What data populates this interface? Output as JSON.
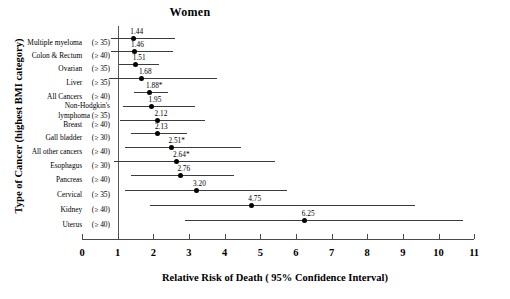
{
  "chart_data": {
    "type": "scatter",
    "subtype": "forest-plot",
    "title": "Women",
    "xlabel": "Relative Risk of Death ( 95% Confidence Interval)",
    "ylabel": "Type of Cancer  (highest BMI category)",
    "xlim": [
      0,
      11
    ],
    "xticks": [
      0,
      1,
      2,
      3,
      4,
      5,
      6,
      7,
      8,
      9,
      10,
      11
    ],
    "xtick_labels": [
      "0",
      "1",
      "2",
      "3",
      "4",
      "5",
      "6",
      "7",
      "8",
      "9",
      "10",
      "11"
    ],
    "grid": false,
    "legend": null,
    "reference_line": 1,
    "annotation_note": "* marks statistically significant estimates",
    "categories": [
      "Multiple myeloma",
      "Colon & Rectum",
      "Ovarian",
      "Liver",
      "All Cancers",
      "Non-Hodgkin's lymphoma",
      "Breast",
      "Gall bladder",
      "All other cancers",
      "Esophagus",
      "Pancreas",
      "Cervical",
      "Kidney",
      "Uterus"
    ],
    "rows": [
      {
        "category": "Multiple myeloma",
        "bmi": "(≥ 35)",
        "value": 1.44,
        "label": "1.44",
        "ci_low": 0.8,
        "ci_high": 2.62,
        "significant": false,
        "two_line": false
      },
      {
        "category": "Colon & Rectum",
        "bmi": "(≥ 40)",
        "value": 1.46,
        "label": "1.46",
        "ci_low": 0.8,
        "ci_high": 2.55,
        "significant": false,
        "two_line": false
      },
      {
        "category": "Ovarian",
        "bmi": "(≥ 35)",
        "value": 1.51,
        "label": "1.51",
        "ci_low": 1.05,
        "ci_high": 2.16,
        "significant": false,
        "two_line": false
      },
      {
        "category": "Liver",
        "bmi": "(≥ 35)",
        "value": 1.68,
        "label": "1.68",
        "ci_low": 0.76,
        "ci_high": 3.78,
        "significant": false,
        "two_line": false
      },
      {
        "category": "All Cancers",
        "bmi": "(≥ 40)",
        "value": 1.88,
        "label": "1.88*",
        "ci_low": 1.46,
        "ci_high": 2.4,
        "significant": true,
        "two_line": false
      },
      {
        "category": "Non-Hodgkin's lymphoma",
        "bmi": "(≥ 35)",
        "value": 1.95,
        "label": "1.95",
        "ci_low": 1.16,
        "ci_high": 3.16,
        "significant": false,
        "two_line": true
      },
      {
        "category": "Breast",
        "bmi": "(≥ 40)",
        "value": 2.12,
        "label": "2.12",
        "ci_low": 1.06,
        "ci_high": 3.45,
        "significant": false,
        "two_line": false
      },
      {
        "category": "Gall bladder",
        "bmi": "(≥ 30)",
        "value": 2.13,
        "label": "2.13",
        "ci_low": 1.37,
        "ci_high": 2.95,
        "significant": false,
        "two_line": false
      },
      {
        "category": "All other cancers",
        "bmi": "(≥ 40)",
        "value": 2.51,
        "label": "2.51*",
        "ci_low": 1.22,
        "ci_high": 4.46,
        "significant": true,
        "two_line": false
      },
      {
        "category": "Esophagus",
        "bmi": "(≥ 30)",
        "value": 2.64,
        "label": "2.64*",
        "ci_low": 0.9,
        "ci_high": 5.4,
        "significant": true,
        "two_line": false
      },
      {
        "category": "Pancreas",
        "bmi": "(≥ 40)",
        "value": 2.76,
        "label": "2.76",
        "ci_low": 1.37,
        "ci_high": 4.26,
        "significant": false,
        "two_line": false
      },
      {
        "category": "Cervical",
        "bmi": "(≥ 35)",
        "value": 3.2,
        "label": "3.20",
        "ci_low": 1.22,
        "ci_high": 5.75,
        "significant": false,
        "two_line": false
      },
      {
        "category": "Kidney",
        "bmi": "(≥ 40)",
        "value": 4.75,
        "label": "4.75",
        "ci_low": 1.9,
        "ci_high": 9.35,
        "significant": false,
        "two_line": false
      },
      {
        "category": "Uterus",
        "bmi": "(≥ 40)",
        "value": 6.25,
        "label": "6.25",
        "ci_low": 2.88,
        "ci_high": 10.7,
        "significant": false,
        "two_line": false
      }
    ]
  },
  "colors": {
    "marker": "#000000",
    "ci_line": "#3c3c3c",
    "axis": "#4a4a4a",
    "reference_line": "#555555",
    "background": "#ffffff",
    "text": "#000000"
  }
}
